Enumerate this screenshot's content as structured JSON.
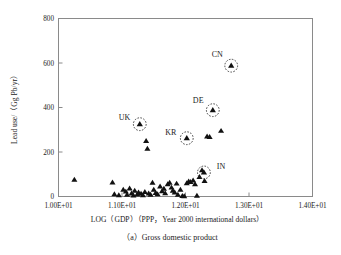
{
  "chart_data": {
    "type": "scatter",
    "title": "",
    "caption": "（a）Gross domestic product",
    "xlabel": "LOG（GDP）（PPP，Year 2000 international dollars）",
    "ylabel": "Lead use/（Gg Pb/yr）",
    "xlim": [
      10.0,
      14.0
    ],
    "ylim": [
      0,
      800
    ],
    "xticks": [
      10.0,
      11.0,
      12.0,
      13.0,
      14.0
    ],
    "xtick_labels": [
      "1.00E+01",
      "1.10E+01",
      "1.20E+01",
      "1.30E+01",
      "1.40E+01"
    ],
    "yticks": [
      0,
      200,
      400,
      600,
      800
    ],
    "ytick_labels": [
      "0",
      "200",
      "400",
      "600",
      "800"
    ],
    "grid": false,
    "legend": "none",
    "marker": "filled-triangle",
    "marker_color": "#111111",
    "highlight_style": "dotted-circle",
    "annotations": [
      {
        "label": "CN",
        "x": 12.72,
        "y": 588,
        "label_dx": -0.22,
        "label_dy": 38
      },
      {
        "label": "DE",
        "x": 12.43,
        "y": 388,
        "label_dx": -0.23,
        "label_dy": 34
      },
      {
        "label": "UK",
        "x": 11.28,
        "y": 325,
        "label_dx": -0.24,
        "label_dy": 18
      },
      {
        "label": "KR",
        "x": 12.02,
        "y": 262,
        "label_dx": -0.25,
        "label_dy": 16
      },
      {
        "label": "IN",
        "x": 12.29,
        "y": 108,
        "label_dx": 0.27,
        "label_dy": 16
      }
    ],
    "points": [
      {
        "x": 10.25,
        "y": 75
      },
      {
        "x": 10.85,
        "y": 63
      },
      {
        "x": 10.88,
        "y": 10
      },
      {
        "x": 10.95,
        "y": 6
      },
      {
        "x": 11.02,
        "y": 30
      },
      {
        "x": 11.06,
        "y": 22
      },
      {
        "x": 11.08,
        "y": 8
      },
      {
        "x": 11.12,
        "y": 36
      },
      {
        "x": 11.15,
        "y": 14
      },
      {
        "x": 11.18,
        "y": 5
      },
      {
        "x": 11.2,
        "y": 26
      },
      {
        "x": 11.24,
        "y": 9
      },
      {
        "x": 11.26,
        "y": 18
      },
      {
        "x": 11.3,
        "y": 12
      },
      {
        "x": 11.33,
        "y": 6
      },
      {
        "x": 11.36,
        "y": 20
      },
      {
        "x": 11.38,
        "y": 250
      },
      {
        "x": 11.4,
        "y": 215
      },
      {
        "x": 11.42,
        "y": 14
      },
      {
        "x": 11.45,
        "y": 8
      },
      {
        "x": 11.48,
        "y": 62
      },
      {
        "x": 11.5,
        "y": 30
      },
      {
        "x": 11.53,
        "y": 16
      },
      {
        "x": 11.56,
        "y": 10
      },
      {
        "x": 11.6,
        "y": 45
      },
      {
        "x": 11.63,
        "y": 24
      },
      {
        "x": 11.66,
        "y": 35
      },
      {
        "x": 11.68,
        "y": 15
      },
      {
        "x": 11.72,
        "y": 55
      },
      {
        "x": 11.75,
        "y": 62
      },
      {
        "x": 11.78,
        "y": 40
      },
      {
        "x": 11.8,
        "y": 26
      },
      {
        "x": 11.83,
        "y": 18
      },
      {
        "x": 11.86,
        "y": 58
      },
      {
        "x": 11.88,
        "y": 8
      },
      {
        "x": 11.92,
        "y": 30
      },
      {
        "x": 11.95,
        "y": 2
      },
      {
        "x": 11.98,
        "y": 1
      },
      {
        "x": 12.02,
        "y": 60
      },
      {
        "x": 12.05,
        "y": 68
      },
      {
        "x": 12.08,
        "y": 65
      },
      {
        "x": 12.12,
        "y": 72
      },
      {
        "x": 12.15,
        "y": 55
      },
      {
        "x": 12.18,
        "y": 3
      },
      {
        "x": 12.22,
        "y": 88
      },
      {
        "x": 12.26,
        "y": 118
      },
      {
        "x": 12.3,
        "y": 70
      },
      {
        "x": 12.34,
        "y": 270
      },
      {
        "x": 12.38,
        "y": 268
      },
      {
        "x": 12.56,
        "y": 295
      }
    ]
  }
}
